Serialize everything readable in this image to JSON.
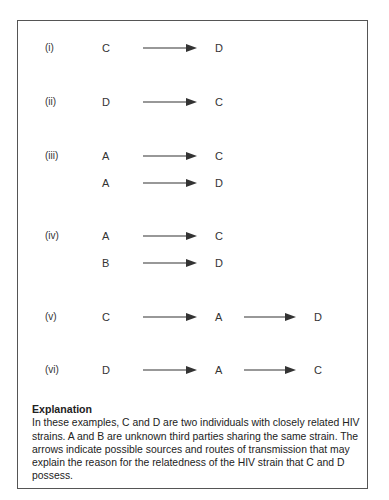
{
  "diagram": {
    "rows": [
      {
        "label": "(i)",
        "chain": [
          "C",
          "D"
        ]
      },
      {
        "label": "(ii)",
        "chain": [
          "D",
          "C"
        ]
      },
      {
        "label": "(iii)",
        "chain": [
          "A",
          "C"
        ]
      },
      {
        "label": "",
        "chain": [
          "A",
          "D"
        ]
      },
      {
        "label": "(iv)",
        "chain": [
          "A",
          "C"
        ]
      },
      {
        "label": "",
        "chain": [
          "B",
          "D"
        ]
      },
      {
        "label": "(v)",
        "chain": [
          "C",
          "A",
          "D"
        ]
      },
      {
        "label": "(vi)",
        "chain": [
          "D",
          "A",
          "C"
        ]
      }
    ],
    "arrow_icon": "right-arrow-icon"
  },
  "explanation": {
    "title": "Explanation",
    "body": "In these examples, C and D are two individuals with closely related HIV strains. A and B are unknown third parties sharing the same strain. The arrows indicate possible sources and routes of transmission that may explain the reason for the relatedness of the HIV strain that C and D possess."
  }
}
